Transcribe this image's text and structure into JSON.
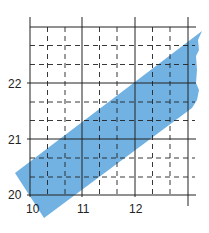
{
  "map": {
    "y_labels": [
      {
        "text": "22",
        "x": 8,
        "y": 78
      },
      {
        "text": "21",
        "x": 8,
        "y": 134
      },
      {
        "text": "20",
        "x": 8,
        "y": 189
      }
    ],
    "x_labels": [
      {
        "text": "10",
        "x": 26,
        "y": 203
      },
      {
        "text": "11",
        "x": 77,
        "y": 203
      },
      {
        "text": "12",
        "x": 129,
        "y": 203
      }
    ],
    "band_color": "#6aaee0",
    "grid_color": "#222222"
  }
}
